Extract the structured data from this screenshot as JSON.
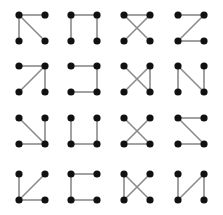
{
  "diagram": {
    "colors": {
      "dot": "#111111",
      "line": "#8a8a8a",
      "background": "#ffffff"
    },
    "col_x": [
      19,
      71,
      124,
      178
    ],
    "row_y": [
      15,
      66,
      118,
      174
    ],
    "cell_w": 26,
    "cell_h": 26,
    "dot_radius": 3.6,
    "nodes_legend": {
      "TL": "top-left",
      "TR": "top-right",
      "BL": "bottom-left",
      "BR": "bottom-right"
    },
    "rows": [
      [
        {
          "edges": [
            [
              "TL",
              "TR"
            ],
            [
              "TL",
              "BL"
            ],
            [
              "TL",
              "BR"
            ]
          ]
        },
        {
          "edges": [
            [
              "TL",
              "TR"
            ],
            [
              "TL",
              "BL"
            ],
            [
              "TR",
              "BR"
            ]
          ]
        },
        {
          "edges": [
            [
              "TL",
              "TR"
            ],
            [
              "TL",
              "BR"
            ],
            [
              "TR",
              "BL"
            ]
          ]
        },
        {
          "edges": [
            [
              "TL",
              "TR"
            ],
            [
              "TR",
              "BL"
            ],
            [
              "BL",
              "BR"
            ]
          ]
        }
      ],
      [
        {
          "edges": [
            [
              "TL",
              "TR"
            ],
            [
              "TR",
              "BL"
            ],
            [
              "TR",
              "BR"
            ]
          ]
        },
        {
          "edges": [
            [
              "TL",
              "TR"
            ],
            [
              "TR",
              "BR"
            ],
            [
              "BL",
              "BR"
            ]
          ]
        },
        {
          "edges": [
            [
              "TL",
              "BR"
            ],
            [
              "TR",
              "BL"
            ],
            [
              "TR",
              "BR"
            ]
          ]
        },
        {
          "edges": [
            [
              "TL",
              "BL"
            ],
            [
              "TL",
              "BR"
            ],
            [
              "TR",
              "BR"
            ]
          ]
        }
      ],
      [
        {
          "edges": [
            [
              "TL",
              "BR"
            ],
            [
              "TR",
              "BR"
            ],
            [
              "BL",
              "BR"
            ]
          ]
        },
        {
          "edges": [
            [
              "TL",
              "BL"
            ],
            [
              "BL",
              "BR"
            ],
            [
              "TR",
              "BR"
            ]
          ]
        },
        {
          "edges": [
            [
              "TL",
              "BR"
            ],
            [
              "TR",
              "BL"
            ],
            [
              "BL",
              "BR"
            ]
          ]
        },
        {
          "edges": [
            [
              "TL",
              "TR"
            ],
            [
              "TL",
              "BR"
            ],
            [
              "BL",
              "BR"
            ]
          ]
        }
      ],
      [
        {
          "edges": [
            [
              "TL",
              "BL"
            ],
            [
              "TR",
              "BL"
            ],
            [
              "BL",
              "BR"
            ]
          ]
        },
        {
          "edges": [
            [
              "TL",
              "TR"
            ],
            [
              "TL",
              "BL"
            ],
            [
              "BL",
              "BR"
            ]
          ]
        },
        {
          "edges": [
            [
              "TL",
              "BL"
            ],
            [
              "TL",
              "BR"
            ],
            [
              "TR",
              "BL"
            ]
          ]
        },
        {
          "edges": [
            [
              "TL",
              "BL"
            ],
            [
              "TR",
              "BL"
            ],
            [
              "TR",
              "BR"
            ]
          ]
        }
      ]
    ]
  }
}
